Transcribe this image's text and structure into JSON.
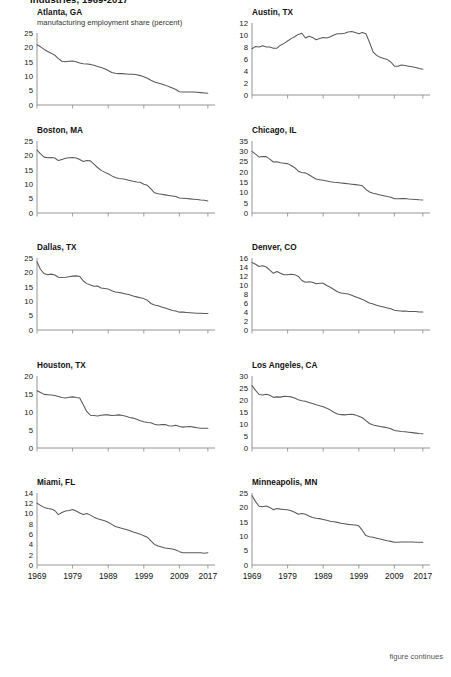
{
  "figure": {
    "title": "industries, 1969-2017",
    "footer": "figure continues",
    "axis_color": "#888888",
    "line_color": "#5a5a5a",
    "subtitle": "manufacturing employment share (percent)"
  },
  "x_tick_labels": [
    "1969",
    "1979",
    "1989",
    "1999",
    "2009",
    "2017"
  ],
  "chart_data": [
    {
      "type": "line",
      "title": "Atlanta, GA",
      "subtitle": "manufacturing employment share (percent)",
      "xlabel": "",
      "ylabel": "",
      "ylim": [
        0,
        25
      ],
      "yticks": [
        0,
        5,
        10,
        15,
        20,
        25
      ],
      "xlim": [
        1969,
        2017
      ],
      "xticks": [
        1969,
        1979,
        1989,
        1999,
        2009,
        2017
      ],
      "grid": false,
      "x": [
        1969,
        1970,
        1971,
        1972,
        1973,
        1974,
        1975,
        1976,
        1977,
        1978,
        1979,
        1980,
        1981,
        1982,
        1983,
        1984,
        1985,
        1986,
        1987,
        1988,
        1989,
        1990,
        1991,
        1992,
        1993,
        1994,
        1995,
        1996,
        1997,
        1998,
        1999,
        2000,
        2001,
        2002,
        2003,
        2004,
        2005,
        2006,
        2007,
        2008,
        2009,
        2010,
        2011,
        2012,
        2013,
        2014,
        2015,
        2016,
        2017
      ],
      "values": [
        20.9,
        20.2,
        19.3,
        18.6,
        18.0,
        17.3,
        16.1,
        15.2,
        15.0,
        15.2,
        15.3,
        15.0,
        14.6,
        14.3,
        14.2,
        14.1,
        13.8,
        13.4,
        13.0,
        12.6,
        12.0,
        11.3,
        11.0,
        10.9,
        10.9,
        10.8,
        10.7,
        10.7,
        10.5,
        10.2,
        9.8,
        9.3,
        8.6,
        8.0,
        7.6,
        7.3,
        6.9,
        6.4,
        5.9,
        5.4,
        4.6,
        4.5,
        4.5,
        4.5,
        4.5,
        4.4,
        4.3,
        4.2,
        4.1
      ]
    },
    {
      "type": "line",
      "title": "Austin, TX",
      "xlabel": "",
      "ylabel": "",
      "ylim": [
        0,
        12
      ],
      "yticks": [
        0,
        2,
        4,
        6,
        8,
        10,
        12
      ],
      "xlim": [
        1969,
        2017
      ],
      "xticks": [
        1969,
        1979,
        1989,
        1999,
        2009,
        2017
      ],
      "grid": false,
      "x": [
        1969,
        1970,
        1971,
        1972,
        1973,
        1974,
        1975,
        1976,
        1977,
        1978,
        1979,
        1980,
        1981,
        1982,
        1983,
        1984,
        1985,
        1986,
        1987,
        1988,
        1989,
        1990,
        1991,
        1992,
        1993,
        1994,
        1995,
        1996,
        1997,
        1998,
        1999,
        2000,
        2001,
        2002,
        2003,
        2004,
        2005,
        2006,
        2007,
        2008,
        2009,
        2010,
        2011,
        2012,
        2013,
        2014,
        2015,
        2016,
        2017
      ],
      "values": [
        7.7,
        8.1,
        8.0,
        8.2,
        8.0,
        8.0,
        7.8,
        7.8,
        8.3,
        8.6,
        9.0,
        9.4,
        9.7,
        10.1,
        10.3,
        9.5,
        9.8,
        9.6,
        9.2,
        9.4,
        9.6,
        9.5,
        9.7,
        10.0,
        10.2,
        10.2,
        10.3,
        10.5,
        10.6,
        10.4,
        10.2,
        10.4,
        10.2,
        8.8,
        7.2,
        6.6,
        6.3,
        6.1,
        5.9,
        5.5,
        4.8,
        4.8,
        5.0,
        4.9,
        4.8,
        4.7,
        4.6,
        4.4,
        4.3
      ]
    },
    {
      "type": "line",
      "title": "Boston, MA",
      "xlabel": "",
      "ylabel": "",
      "ylim": [
        0,
        25
      ],
      "yticks": [
        0,
        5,
        10,
        15,
        20,
        25
      ],
      "xlim": [
        1969,
        2017
      ],
      "xticks": [
        1969,
        1979,
        1989,
        1999,
        2009,
        2017
      ],
      "grid": false,
      "x": [
        1969,
        1970,
        1971,
        1972,
        1973,
        1974,
        1975,
        1976,
        1977,
        1978,
        1979,
        1980,
        1981,
        1982,
        1983,
        1984,
        1985,
        1986,
        1987,
        1988,
        1989,
        1990,
        1991,
        1992,
        1993,
        1994,
        1995,
        1996,
        1997,
        1998,
        1999,
        2000,
        2001,
        2002,
        2003,
        2004,
        2005,
        2006,
        2007,
        2008,
        2009,
        2010,
        2011,
        2012,
        2013,
        2014,
        2015,
        2016,
        2017
      ],
      "values": [
        21.8,
        20.5,
        19.4,
        19.2,
        19.3,
        19.1,
        18.2,
        18.6,
        19.0,
        19.2,
        19.3,
        19.1,
        18.6,
        17.9,
        18.2,
        18.1,
        17.0,
        15.8,
        14.8,
        14.2,
        13.6,
        12.9,
        12.3,
        12.0,
        11.9,
        11.6,
        11.3,
        11.0,
        10.8,
        10.7,
        10.0,
        9.6,
        8.4,
        7.0,
        6.7,
        6.5,
        6.3,
        6.1,
        5.9,
        5.7,
        5.2,
        5.1,
        5.0,
        4.9,
        4.8,
        4.7,
        4.5,
        4.4,
        4.2
      ]
    },
    {
      "type": "line",
      "title": "Chicago, IL",
      "xlabel": "",
      "ylabel": "",
      "ylim": [
        0,
        35
      ],
      "yticks": [
        0,
        5,
        10,
        15,
        20,
        25,
        30,
        35
      ],
      "xlim": [
        1969,
        2017
      ],
      "xticks": [
        1969,
        1979,
        1989,
        1999,
        2009,
        2017
      ],
      "grid": false,
      "x": [
        1969,
        1970,
        1971,
        1972,
        1973,
        1974,
        1975,
        1976,
        1977,
        1978,
        1979,
        1980,
        1981,
        1982,
        1983,
        1984,
        1985,
        1986,
        1987,
        1988,
        1989,
        1990,
        1991,
        1992,
        1993,
        1994,
        1995,
        1996,
        1997,
        1998,
        1999,
        2000,
        2001,
        2002,
        2003,
        2004,
        2005,
        2006,
        2007,
        2008,
        2009,
        2010,
        2011,
        2012,
        2013,
        2014,
        2015,
        2016,
        2017
      ],
      "values": [
        30.0,
        28.6,
        27.2,
        27.5,
        27.4,
        26.2,
        24.8,
        24.9,
        24.4,
        24.2,
        24.0,
        23.1,
        22.0,
        20.3,
        19.7,
        19.5,
        18.6,
        17.5,
        16.5,
        16.2,
        15.9,
        15.6,
        15.2,
        14.9,
        14.8,
        14.6,
        14.4,
        14.2,
        14.0,
        13.8,
        13.6,
        13.2,
        11.5,
        10.2,
        9.6,
        9.2,
        8.8,
        8.4,
        8.0,
        7.7,
        6.9,
        6.9,
        7.0,
        7.0,
        6.8,
        6.7,
        6.6,
        6.4,
        6.3
      ]
    },
    {
      "type": "line",
      "title": "Dallas, TX",
      "xlabel": "",
      "ylabel": "",
      "ylim": [
        0,
        25
      ],
      "yticks": [
        0,
        5,
        10,
        15,
        20,
        25
      ],
      "xlim": [
        1969,
        2017
      ],
      "xticks": [
        1969,
        1979,
        1989,
        1999,
        2009,
        2017
      ],
      "grid": false,
      "x": [
        1969,
        1970,
        1971,
        1972,
        1973,
        1974,
        1975,
        1976,
        1977,
        1978,
        1979,
        1980,
        1981,
        1982,
        1983,
        1984,
        1985,
        1986,
        1987,
        1988,
        1989,
        1990,
        1991,
        1992,
        1993,
        1994,
        1995,
        1996,
        1997,
        1998,
        1999,
        2000,
        2001,
        2002,
        2003,
        2004,
        2005,
        2006,
        2007,
        2008,
        2009,
        2010,
        2011,
        2012,
        2013,
        2014,
        2015,
        2016,
        2017
      ],
      "values": [
        23.7,
        21.0,
        19.6,
        19.2,
        19.4,
        19.1,
        18.3,
        18.2,
        18.3,
        18.5,
        18.7,
        18.8,
        18.6,
        17.0,
        16.1,
        15.6,
        15.2,
        15.3,
        14.6,
        14.4,
        14.2,
        13.6,
        13.2,
        13.0,
        12.8,
        12.5,
        12.2,
        11.8,
        11.5,
        11.2,
        10.9,
        10.3,
        9.2,
        8.7,
        8.4,
        8.0,
        7.6,
        7.2,
        6.8,
        6.6,
        6.2,
        6.2,
        6.1,
        6.0,
        5.9,
        5.8,
        5.8,
        5.7,
        5.7
      ]
    },
    {
      "type": "line",
      "title": "Denver, CO",
      "xlabel": "",
      "ylabel": "",
      "ylim": [
        0,
        16
      ],
      "yticks": [
        0,
        2,
        4,
        6,
        8,
        10,
        12,
        14,
        16
      ],
      "xlim": [
        1969,
        2017
      ],
      "xticks": [
        1969,
        1979,
        1989,
        1999,
        2009,
        2017
      ],
      "grid": false,
      "x": [
        1969,
        1970,
        1971,
        1972,
        1973,
        1974,
        1975,
        1976,
        1977,
        1978,
        1979,
        1980,
        1981,
        1982,
        1983,
        1984,
        1985,
        1986,
        1987,
        1988,
        1989,
        1990,
        1991,
        1992,
        1993,
        1994,
        1995,
        1996,
        1997,
        1998,
        1999,
        2000,
        2001,
        2002,
        2003,
        2004,
        2005,
        2006,
        2007,
        2008,
        2009,
        2010,
        2011,
        2012,
        2013,
        2014,
        2015,
        2016,
        2017
      ],
      "values": [
        15.0,
        14.6,
        14.1,
        14.3,
        14.0,
        13.3,
        12.6,
        13.0,
        12.6,
        12.3,
        12.3,
        12.4,
        12.3,
        11.9,
        11.0,
        10.6,
        10.7,
        10.6,
        10.3,
        10.4,
        10.4,
        9.9,
        9.5,
        9.0,
        8.5,
        8.2,
        8.1,
        8.0,
        7.7,
        7.4,
        7.1,
        6.8,
        6.4,
        6.0,
        5.8,
        5.5,
        5.3,
        5.1,
        4.9,
        4.7,
        4.4,
        4.3,
        4.2,
        4.2,
        4.1,
        4.1,
        4.1,
        4.0,
        4.0
      ]
    },
    {
      "type": "line",
      "title": "Houston, TX",
      "xlabel": "",
      "ylabel": "",
      "ylim": [
        0,
        20
      ],
      "yticks": [
        0,
        5,
        10,
        15,
        20
      ],
      "xlim": [
        1969,
        2017
      ],
      "xticks": [
        1969,
        1979,
        1989,
        1999,
        2009,
        2017
      ],
      "grid": false,
      "x": [
        1969,
        1970,
        1971,
        1972,
        1973,
        1974,
        1975,
        1976,
        1977,
        1978,
        1979,
        1980,
        1981,
        1982,
        1983,
        1984,
        1985,
        1986,
        1987,
        1988,
        1989,
        1990,
        1991,
        1992,
        1993,
        1994,
        1995,
        1996,
        1997,
        1998,
        1999,
        2000,
        2001,
        2002,
        2003,
        2004,
        2005,
        2006,
        2007,
        2008,
        2009,
        2010,
        2011,
        2012,
        2013,
        2014,
        2015,
        2016,
        2017
      ],
      "values": [
        15.9,
        15.4,
        14.9,
        14.8,
        14.7,
        14.6,
        14.3,
        14.0,
        13.9,
        14.1,
        14.2,
        14.0,
        13.9,
        12.0,
        10.1,
        9.1,
        9.0,
        8.9,
        9.1,
        9.2,
        9.2,
        9.0,
        9.1,
        9.2,
        9.0,
        8.8,
        8.5,
        8.3,
        8.0,
        7.6,
        7.3,
        7.1,
        7.0,
        6.6,
        6.4,
        6.5,
        6.5,
        6.2,
        6.1,
        6.3,
        6.0,
        5.8,
        5.9,
        6.0,
        5.8,
        5.6,
        5.5,
        5.5,
        5.5
      ]
    },
    {
      "type": "line",
      "title": "Los Angeles, CA",
      "xlabel": "",
      "ylabel": "",
      "ylim": [
        0,
        30
      ],
      "yticks": [
        0,
        5,
        10,
        15,
        20,
        25,
        30
      ],
      "xlim": [
        1969,
        2017
      ],
      "xticks": [
        1969,
        1979,
        1989,
        1999,
        2009,
        2017
      ],
      "grid": false,
      "x": [
        1969,
        1970,
        1971,
        1972,
        1973,
        1974,
        1975,
        1976,
        1977,
        1978,
        1979,
        1980,
        1981,
        1982,
        1983,
        1984,
        1985,
        1986,
        1987,
        1988,
        1989,
        1990,
        1991,
        1992,
        1993,
        1994,
        1995,
        1996,
        1997,
        1998,
        1999,
        2000,
        2001,
        2002,
        2003,
        2004,
        2005,
        2006,
        2007,
        2008,
        2009,
        2010,
        2011,
        2012,
        2013,
        2014,
        2015,
        2016,
        2017
      ],
      "values": [
        26.0,
        24.0,
        22.3,
        22.1,
        22.4,
        22.0,
        21.1,
        21.3,
        21.2,
        21.6,
        21.5,
        21.3,
        20.8,
        20.1,
        19.7,
        19.5,
        19.0,
        18.5,
        18.0,
        17.6,
        17.2,
        16.6,
        15.8,
        14.9,
        14.2,
        13.9,
        13.8,
        14.0,
        14.1,
        13.8,
        13.2,
        12.6,
        11.4,
        10.2,
        9.6,
        9.3,
        9.0,
        8.7,
        8.4,
        8.0,
        7.3,
        7.1,
        6.9,
        6.8,
        6.6,
        6.4,
        6.2,
        6.0,
        5.9
      ]
    },
    {
      "type": "line",
      "title": "Miami, FL",
      "xlabel": "",
      "ylabel": "",
      "ylim": [
        0,
        14
      ],
      "yticks": [
        0,
        2,
        4,
        6,
        8,
        10,
        12,
        14
      ],
      "xlim": [
        1969,
        2017
      ],
      "xticks": [
        1969,
        1979,
        1989,
        1999,
        2009,
        2017
      ],
      "grid": false,
      "x": [
        1969,
        1970,
        1971,
        1972,
        1973,
        1974,
        1975,
        1976,
        1977,
        1978,
        1979,
        1980,
        1981,
        1982,
        1983,
        1984,
        1985,
        1986,
        1987,
        1988,
        1989,
        1990,
        1991,
        1992,
        1993,
        1994,
        1995,
        1996,
        1997,
        1998,
        1999,
        2000,
        2001,
        2002,
        2003,
        2004,
        2005,
        2006,
        2007,
        2008,
        2009,
        2010,
        2011,
        2012,
        2013,
        2014,
        2015,
        2016,
        2017
      ],
      "values": [
        12.0,
        11.6,
        11.2,
        11.0,
        10.9,
        10.6,
        9.8,
        10.2,
        10.5,
        10.6,
        10.8,
        10.5,
        10.1,
        9.8,
        10.0,
        9.7,
        9.3,
        9.0,
        8.8,
        8.6,
        8.3,
        7.9,
        7.5,
        7.3,
        7.1,
        6.9,
        6.7,
        6.4,
        6.2,
        6.0,
        5.7,
        5.4,
        4.7,
        4.0,
        3.7,
        3.5,
        3.3,
        3.2,
        3.1,
        2.9,
        2.6,
        2.4,
        2.4,
        2.4,
        2.4,
        2.4,
        2.4,
        2.3,
        2.4
      ]
    },
    {
      "type": "line",
      "title": "Minneapolis, MN",
      "xlabel": "",
      "ylabel": "",
      "ylim": [
        0,
        25
      ],
      "yticks": [
        0,
        5,
        10,
        15,
        20,
        25
      ],
      "xlim": [
        1969,
        2017
      ],
      "xticks": [
        1969,
        1979,
        1989,
        1999,
        2009,
        2017
      ],
      "grid": false,
      "x": [
        1969,
        1970,
        1971,
        1972,
        1973,
        1974,
        1975,
        1976,
        1977,
        1978,
        1979,
        1980,
        1981,
        1982,
        1983,
        1984,
        1985,
        1986,
        1987,
        1988,
        1989,
        1990,
        1991,
        1992,
        1993,
        1994,
        1995,
        1996,
        1997,
        1998,
        1999,
        2000,
        2001,
        2002,
        2003,
        2004,
        2005,
        2006,
        2007,
        2008,
        2009,
        2010,
        2011,
        2012,
        2013,
        2014,
        2015,
        2016,
        2017
      ],
      "values": [
        24.1,
        22.0,
        20.4,
        20.2,
        20.5,
        20.0,
        19.2,
        19.6,
        19.4,
        19.3,
        19.2,
        18.8,
        18.3,
        17.6,
        17.9,
        17.6,
        17.0,
        16.5,
        16.2,
        16.1,
        15.8,
        15.5,
        15.2,
        15.0,
        14.8,
        14.5,
        14.3,
        14.1,
        14.0,
        13.9,
        13.6,
        12.0,
        10.2,
        9.8,
        9.6,
        9.3,
        9.0,
        8.7,
        8.4,
        8.2,
        7.9,
        7.9,
        8.0,
        8.0,
        8.0,
        8.0,
        7.9,
        7.9,
        7.9
      ]
    }
  ]
}
